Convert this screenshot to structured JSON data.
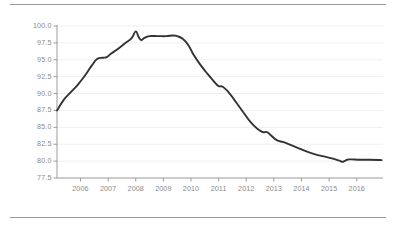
{
  "chart_data": {
    "type": "line",
    "title": "",
    "subtitle": "",
    "xlabel": "",
    "ylabel": "",
    "grid": true,
    "legend": null,
    "xlim": [
      2005.15,
      2016.95
    ],
    "ylim": [
      77.5,
      100.0
    ],
    "yticks": [
      "100.0",
      "97.5",
      "95.0",
      "92.5",
      "90.0",
      "87.5",
      "85.0",
      "82.5",
      "80.0",
      "77.5"
    ],
    "ytick_values": [
      100.0,
      97.5,
      95.0,
      92.5,
      90.0,
      87.5,
      85.0,
      82.5,
      80.0,
      77.5
    ],
    "xticks": [
      "2006",
      "2007",
      "2008",
      "2009",
      "2010",
      "2011",
      "2012",
      "2013",
      "2014",
      "2015",
      "2016"
    ],
    "xtick_values": [
      2006,
      2007,
      2008,
      2009,
      2010,
      2011,
      2012,
      2013,
      2014,
      2015,
      2016
    ],
    "line_color": "#333333",
    "grid_color": "#efefef",
    "axis_color": "#9a9a9a",
    "label_color": "#8a8a8a",
    "series": [
      {
        "name": "index",
        "x": [
          2005.15,
          2005.4,
          2005.65,
          2005.9,
          2006.15,
          2006.4,
          2006.6,
          2006.8,
          2006.95,
          2007.1,
          2007.35,
          2007.6,
          2007.85,
          2008.0,
          2008.1,
          2008.2,
          2008.3,
          2008.5,
          2008.8,
          2009.1,
          2009.35,
          2009.5,
          2009.7,
          2009.9,
          2010.1,
          2010.35,
          2010.6,
          2010.85,
          2011.0,
          2011.15,
          2011.4,
          2011.65,
          2011.9,
          2012.15,
          2012.4,
          2012.6,
          2012.75,
          2012.9,
          2013.1,
          2013.35,
          2013.6,
          2013.9,
          2014.2,
          2014.5,
          2014.8,
          2015.1,
          2015.35,
          2015.5,
          2015.65,
          2015.8,
          2016.1,
          2016.45,
          2016.9
        ],
        "y": [
          87.5,
          89.1,
          90.2,
          91.3,
          92.6,
          94.1,
          95.1,
          95.3,
          95.4,
          95.9,
          96.6,
          97.4,
          98.2,
          99.2,
          98.4,
          97.9,
          98.2,
          98.5,
          98.5,
          98.5,
          98.6,
          98.5,
          98.1,
          97.2,
          95.7,
          94.2,
          92.9,
          91.7,
          91.1,
          91.0,
          90.0,
          88.6,
          87.2,
          85.8,
          84.8,
          84.3,
          84.3,
          83.8,
          83.1,
          82.8,
          82.4,
          81.9,
          81.4,
          81.0,
          80.7,
          80.4,
          80.1,
          79.9,
          80.2,
          80.25,
          80.2,
          80.2,
          80.15
        ]
      }
    ]
  }
}
